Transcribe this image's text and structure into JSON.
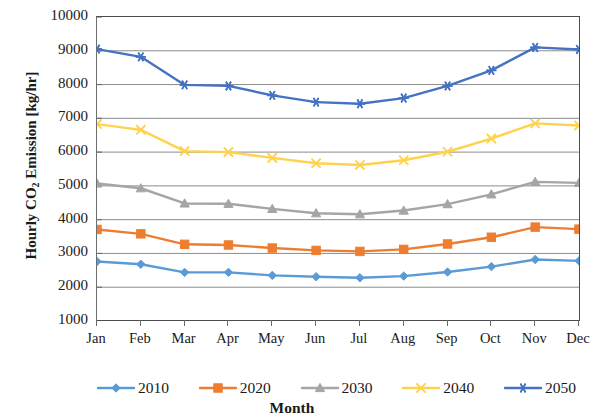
{
  "chart_data": {
    "type": "line",
    "title": "",
    "xlabel": "Month",
    "ylabel": "Hourly CO2 Emission [kg/hr]",
    "ylabel_parts": {
      "pre": "Hourly CO",
      "sub": "2",
      "post": " Emission [kg/hr]"
    },
    "categories": [
      "Jan",
      "Feb",
      "Mar",
      "Apr",
      "May",
      "Jun",
      "Jul",
      "Aug",
      "Sep",
      "Oct",
      "Nov",
      "Dec"
    ],
    "ylim": [
      1000,
      10000
    ],
    "yticks": [
      1000,
      2000,
      3000,
      4000,
      5000,
      6000,
      7000,
      8000,
      9000,
      10000
    ],
    "ytick_labels": [
      "1000",
      "2000",
      "3000",
      "4000",
      "5000",
      "6000",
      "7000",
      "8000",
      "9000",
      "10000"
    ],
    "grid": true,
    "grid_axis": "y",
    "legend_position": "bottom",
    "series": [
      {
        "name": "2010",
        "color": "#5B9BD5",
        "marker": "diamond",
        "values": [
          2760,
          2680,
          2440,
          2440,
          2350,
          2310,
          2280,
          2330,
          2450,
          2610,
          2820,
          2780
        ]
      },
      {
        "name": "2020",
        "color": "#ED7D31",
        "marker": "square",
        "values": [
          3710,
          3580,
          3270,
          3250,
          3160,
          3090,
          3060,
          3120,
          3280,
          3480,
          3780,
          3720
        ]
      },
      {
        "name": "2030",
        "color": "#A5A5A5",
        "marker": "triangle",
        "values": [
          5070,
          4930,
          4480,
          4470,
          4320,
          4190,
          4160,
          4270,
          4460,
          4750,
          5120,
          5090
        ]
      },
      {
        "name": "2040",
        "color": "#FFD24D",
        "marker": "cross",
        "values": [
          6830,
          6660,
          6030,
          6000,
          5830,
          5670,
          5620,
          5760,
          6010,
          6400,
          6850,
          6790
        ]
      },
      {
        "name": "2050",
        "color": "#4472C4",
        "marker": "asterisk",
        "values": [
          9050,
          8820,
          7990,
          7960,
          7680,
          7480,
          7430,
          7600,
          7960,
          8420,
          9100,
          9040
        ]
      }
    ]
  }
}
